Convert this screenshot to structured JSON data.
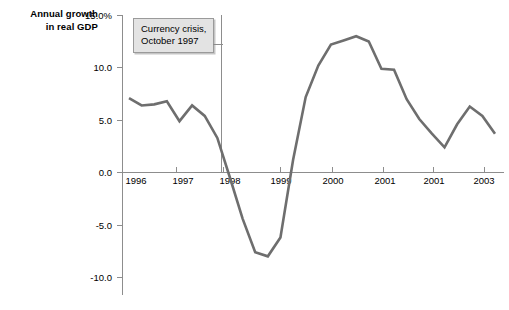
{
  "figure": {
    "axis_title_line1": "Annual growth",
    "axis_title_line2": "in real GDP",
    "line_color": "#6e6e6e",
    "axis_color": "#8d8d8d",
    "callout_fill": "#e3e3e3",
    "callout_border": "#9a9a9a"
  },
  "annotation": {
    "line1": "Currency crisis,",
    "line2": "October 1997"
  },
  "chart_data": {
    "type": "line",
    "title": "Annual growth in real GDP",
    "xlabel": "",
    "ylabel": "Annual growth in real GDP",
    "ylim": [
      -11.5,
      15.0
    ],
    "xlim": [
      1995.6,
      2003.4
    ],
    "grid": false,
    "legend": null,
    "ytick_labels": [
      "15.0%",
      "10.0",
      "5.0",
      "0.0",
      "-5.0",
      "-10.0"
    ],
    "ytick_values": [
      15.0,
      10.0,
      5.0,
      0.0,
      -5.0,
      -10.0
    ],
    "xtick_labels": [
      "1996",
      "1997",
      "1998",
      "1999",
      "2000",
      "2001",
      "2001",
      "2003"
    ],
    "xtick_values": [
      1996,
      1997,
      1998,
      1999,
      2000,
      2001,
      2002,
      2003
    ],
    "annotations": [
      {
        "text": "Currency crisis, October 1997",
        "type": "vertical-line-callout",
        "x": 1997.8
      }
    ],
    "series": [
      {
        "name": "Annual growth in real GDP",
        "color": "#6e6e6e",
        "x": [
          1996.0,
          1996.25,
          1996.5,
          1996.75,
          1997.0,
          1997.25,
          1997.5,
          1997.75,
          1998.0,
          1998.25,
          1998.5,
          1998.75,
          1999.0,
          1999.25,
          1999.5,
          1999.75,
          2000.0,
          2000.25,
          2000.5,
          2000.75,
          2001.0,
          2001.25,
          2001.5,
          2001.75,
          2002.0,
          2002.25,
          2002.5,
          2002.75,
          2003.0,
          2003.25
        ],
        "y": [
          7.1,
          6.4,
          6.5,
          6.8,
          4.9,
          6.4,
          5.4,
          3.3,
          -0.5,
          -4.4,
          -7.6,
          -8.0,
          -6.2,
          1.2,
          7.2,
          10.2,
          12.2,
          12.6,
          13.0,
          12.5,
          9.9,
          9.8,
          7.0,
          5.1,
          3.7,
          2.4,
          4.6,
          6.3,
          5.4,
          3.7
        ]
      }
    ]
  }
}
